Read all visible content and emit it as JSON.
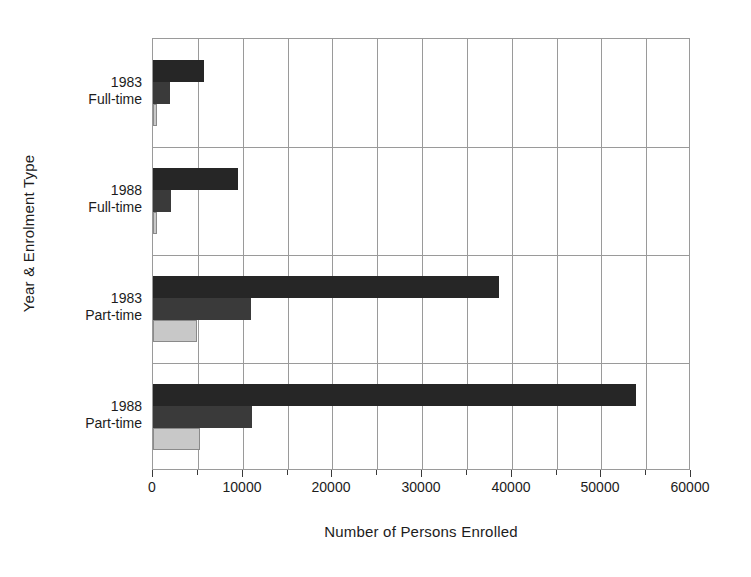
{
  "chart_data": {
    "type": "bar",
    "orientation": "horizontal",
    "title": "",
    "xlabel": "Number of Persons Enrolled",
    "ylabel": "Year & Enrolment Type",
    "categories": [
      "1983 Full-time",
      "1988 Full-time",
      "1983 Part-time",
      "1988 Part-time"
    ],
    "category_lines": [
      [
        "1983",
        "Full-time"
      ],
      [
        "1988",
        "Full-time"
      ],
      [
        "1983",
        "Part-time"
      ],
      [
        "1988",
        "Part-time"
      ]
    ],
    "series": [
      {
        "name": "series-1",
        "color": "#262626",
        "values": [
          5700,
          9500,
          38600,
          53900
        ]
      },
      {
        "name": "series-2",
        "color": "#3a3a3a",
        "values": [
          1900,
          2000,
          10900,
          11000
        ]
      },
      {
        "name": "series-3",
        "color": "#c8c8c8",
        "values": [
          450,
          450,
          4900,
          5200
        ]
      }
    ],
    "xlim": [
      0,
      60000
    ],
    "ylim": [
      0,
      4
    ],
    "xticks": [
      0,
      10000,
      20000,
      30000,
      40000,
      50000,
      60000
    ],
    "xtick_labels": [
      "0",
      "10000",
      "20000",
      "30000",
      "40000",
      "50000",
      "60000"
    ],
    "xminor_ticks": [
      5000,
      15000,
      25000,
      35000,
      45000,
      55000
    ],
    "grid": {
      "vertical": true,
      "horizontal": true
    },
    "legend": {
      "visible": false
    },
    "plot_border_color": "#9a9a9a",
    "gridline_color": "#9a9a9a",
    "background_color": "#ffffff"
  },
  "geometry": {
    "plot_left": 152,
    "plot_top": 38,
    "plot_width": 538,
    "plot_height": 432
  }
}
